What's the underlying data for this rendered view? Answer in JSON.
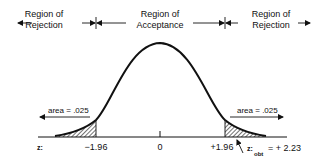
{
  "regions": {
    "left_rejection": {
      "line1": "Region of",
      "line2": "Rejection"
    },
    "acceptance": {
      "line1": "Region of",
      "line2": "Acceptance"
    },
    "right_rejection": {
      "line1": "Region of",
      "line2": "Rejection"
    }
  },
  "areas": {
    "left": "area = .025",
    "right": "area = .025"
  },
  "axis": {
    "variable_label": "z:",
    "ticks": [
      "−1.96",
      "0",
      "+1.96"
    ]
  },
  "observed": {
    "label_prefix": "z:",
    "subscript": "obt",
    "value_text": "= + 2.23"
  },
  "colors": {
    "ink": "#111111",
    "background": "#ffffff"
  }
}
